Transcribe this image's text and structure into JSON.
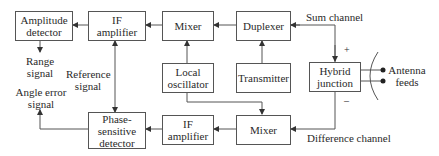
{
  "blocks": {
    "amplitude_detector": "Amplitude detector",
    "if_amplifier_top": "IF amplifier",
    "mixer_top": "Mixer",
    "duplexer": "Duplexer",
    "local_oscillator": "Local oscillator",
    "transmitter": "Transmitter",
    "hybrid_junction": "Hybrid junction",
    "phase_sensitive_detector": "Phase-sensitive detector",
    "if_amplifier_bottom": "IF amplifier",
    "mixer_bottom": "Mixer"
  },
  "labels": {
    "sum_channel": "Sum channel",
    "difference_channel": "Difference channel",
    "range_signal": "Range signal",
    "reference_signal": "Reference signal",
    "angle_error_signal": "Angle error signal",
    "antenna_feeds": "Antenna feeds",
    "plus": "+",
    "minus": "–"
  }
}
